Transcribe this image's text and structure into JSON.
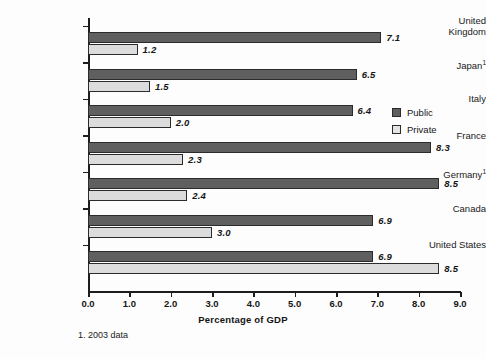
{
  "chart_data": {
    "type": "bar",
    "orientation": "horizontal",
    "title": "",
    "xlabel": "Percentage of GDP",
    "ylabel": "",
    "xlim": [
      0.0,
      9.0
    ],
    "xticks": [
      "0.0",
      "1.0",
      "2.0",
      "3.0",
      "4.0",
      "5.0",
      "6.0",
      "7.0",
      "8.0",
      "9.0"
    ],
    "grid": false,
    "legend_position": "right",
    "categories": [
      {
        "label": "United\nKingdom",
        "footnote_marker": ""
      },
      {
        "label": "Japan",
        "footnote_marker": "1"
      },
      {
        "label": "Italy",
        "footnote_marker": ""
      },
      {
        "label": "France",
        "footnote_marker": ""
      },
      {
        "label": "Germany",
        "footnote_marker": "1"
      },
      {
        "label": "Canada",
        "footnote_marker": ""
      },
      {
        "label": "United States",
        "footnote_marker": ""
      }
    ],
    "series": [
      {
        "name": "Public",
        "color": "#5f5f5f",
        "values": [
          7.1,
          6.5,
          6.4,
          8.3,
          8.5,
          6.9,
          6.9
        ],
        "labels": [
          "7.1",
          "6.5",
          "6.4",
          "8.3",
          "8.5",
          "6.9",
          "6.9"
        ]
      },
      {
        "name": "Private",
        "color": "#dcdcdc",
        "values": [
          1.2,
          1.5,
          2.0,
          2.3,
          2.4,
          3.0,
          8.5
        ],
        "labels": [
          "1.2",
          "1.5",
          "2.0",
          "2.3",
          "2.4",
          "3.0",
          "8.5"
        ]
      }
    ],
    "footnote": "1. 2003 data"
  },
  "legend": {
    "items": [
      {
        "label": "Public",
        "color": "#5f5f5f"
      },
      {
        "label": "Private",
        "color": "#e4e4e4"
      }
    ]
  },
  "axis": {
    "x_title": "Percentage of GDP"
  },
  "footnote": {
    "text": "1. 2003 data"
  }
}
